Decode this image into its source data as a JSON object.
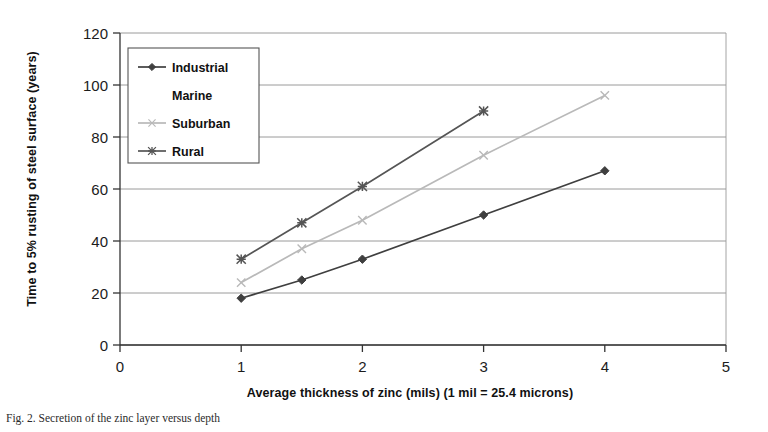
{
  "figure": {
    "caption": "Fig. 2. Secretion of the zinc layer versus depth"
  },
  "chart_data": {
    "type": "line",
    "title": "",
    "xlabel": "Average thickness of zinc (mils)  (1 mil = 25.4 microns)",
    "ylabel": "Time to 5% rusting of steel surface  (years)",
    "xlim": [
      0,
      5
    ],
    "ylim": [
      0,
      120
    ],
    "xticks": [
      "0",
      "1",
      "2",
      "3",
      "4",
      "5"
    ],
    "xtick_values": [
      0,
      1,
      2,
      3,
      4,
      5
    ],
    "yticks": [
      "0",
      "20",
      "40",
      "60",
      "80",
      "100",
      "120"
    ],
    "ytick_values": [
      0,
      20,
      40,
      60,
      80,
      100,
      120
    ],
    "grid": "horizontal",
    "legend_position": "upper-left-inside",
    "series": [
      {
        "name": "Industrial",
        "marker": "diamond",
        "color": "#3f3f3f",
        "x": [
          1,
          1.5,
          2,
          3,
          4
        ],
        "values": [
          18,
          25,
          33,
          50,
          67
        ]
      },
      {
        "name": "Marine",
        "marker": "none",
        "color": "#9a9a9a",
        "x": [],
        "values": []
      },
      {
        "name": "Suburban",
        "marker": "x",
        "color": "#b9b9b9",
        "x": [
          1,
          1.5,
          2,
          3,
          4
        ],
        "values": [
          24,
          37,
          48,
          73,
          96
        ]
      },
      {
        "name": "Rural",
        "marker": "asterisk",
        "color": "#555555",
        "x": [
          1,
          1.5,
          2,
          3
        ],
        "values": [
          33,
          47,
          61,
          90
        ]
      }
    ]
  }
}
